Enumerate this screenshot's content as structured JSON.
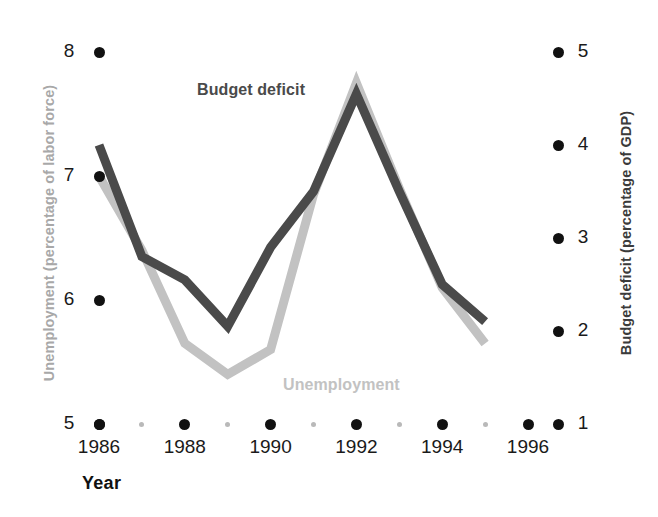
{
  "chart_data": {
    "type": "line",
    "title": "",
    "xlabel": "Year",
    "x": [
      1986,
      1987,
      1988,
      1989,
      1990,
      1991,
      1992,
      1993,
      1994,
      1995
    ],
    "xlim": [
      1986,
      1996.7
    ],
    "xticks_major": [
      1986,
      1988,
      1990,
      1992,
      1994,
      1996
    ],
    "xticks_minor": [
      1987,
      1989,
      1991,
      1993,
      1995
    ],
    "xtick_labels": [
      "1986",
      "1988",
      "1990",
      "1992",
      "1994",
      "1996"
    ],
    "grid": false,
    "legend_position": "inline-annotations",
    "axes": [
      {
        "id": "left",
        "label": "Unemployment (percentage of labor force)",
        "ylim": [
          5,
          8
        ],
        "yticks": [
          5,
          6,
          7,
          8
        ],
        "ytick_labels": [
          "5",
          "6",
          "7",
          "8"
        ],
        "color": "#a8a8a8"
      },
      {
        "id": "right",
        "label": "Budget deficit (percentage of GDP)",
        "ylim": [
          1,
          5
        ],
        "yticks": [
          1,
          2,
          3,
          4,
          5
        ],
        "ytick_labels": [
          "1",
          "2",
          "3",
          "4",
          "5"
        ],
        "color": "#3b3b3b"
      }
    ],
    "series": [
      {
        "name": "Budget deficit",
        "axis": "right",
        "color": "#4a4a4a",
        "annotation": "Budget deficit",
        "values": [
          4.0,
          2.8,
          2.55,
          2.05,
          2.9,
          3.5,
          4.55,
          3.5,
          2.5,
          2.1
        ]
      },
      {
        "name": "Unemployment",
        "axis": "left",
        "color": "#c2c2c2",
        "annotation": "Unemployment",
        "values": [
          7.0,
          6.4,
          5.65,
          5.4,
          5.6,
          6.85,
          7.75,
          6.9,
          6.1,
          5.65
        ]
      }
    ]
  },
  "colors": {
    "deficit_line": "#4a4a4a",
    "unemployment_line": "#c2c2c2",
    "tick_major": "#111111",
    "tick_minor": "#b9b9b9",
    "background": "#ffffff"
  }
}
